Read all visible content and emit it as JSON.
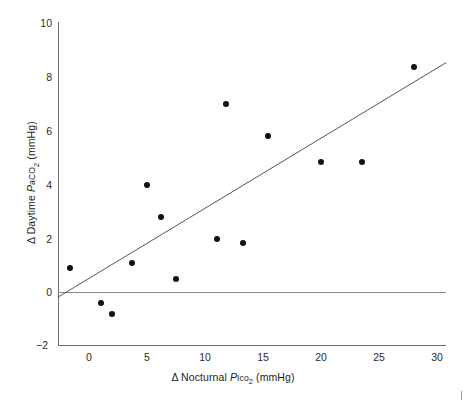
{
  "chart_data": {
    "type": "scatter",
    "title": "",
    "xlabel": "Δ Nocturnal PIco2 (mmHg)",
    "ylabel": "Δ Daytime PaCO2 (mmHg)",
    "xlim": [
      -2.7,
      30.8
    ],
    "ylim": [
      -2,
      10
    ],
    "xticks": [
      0,
      5,
      10,
      15,
      20,
      25,
      30
    ],
    "yticks": [
      -2,
      0,
      2,
      4,
      6,
      8,
      10
    ],
    "grid": false,
    "legend": null,
    "x": [
      -1.6,
      1.0,
      2.0,
      3.7,
      5.0,
      6.2,
      7.5,
      11.0,
      11.8,
      13.3,
      15.4,
      20.0,
      23.5,
      28.0
    ],
    "y": [
      0.9,
      -0.4,
      -0.8,
      1.1,
      4.0,
      2.8,
      0.5,
      2.0,
      7.0,
      1.85,
      5.8,
      4.85,
      4.85,
      8.4
    ],
    "points": [
      {
        "x": -1.6,
        "y": 0.9
      },
      {
        "x": 1.0,
        "y": -0.4
      },
      {
        "x": 2.0,
        "y": -0.8
      },
      {
        "x": 3.7,
        "y": 1.1
      },
      {
        "x": 5.0,
        "y": 4.0
      },
      {
        "x": 6.2,
        "y": 2.8
      },
      {
        "x": 7.5,
        "y": 0.5
      },
      {
        "x": 11.0,
        "y": 2.0
      },
      {
        "x": 11.8,
        "y": 7.0
      },
      {
        "x": 13.3,
        "y": 1.85
      },
      {
        "x": 15.4,
        "y": 5.8
      },
      {
        "x": 20.0,
        "y": 4.85
      },
      {
        "x": 23.5,
        "y": 4.85
      },
      {
        "x": 28.0,
        "y": 8.4
      }
    ],
    "marker": {
      "shape": "circle",
      "color": "#111111",
      "size": 6
    },
    "annotations": [
      {
        "name": "regression-line",
        "type": "line",
        "x0": -2.7,
        "y0": -0.18,
        "x1": 30.8,
        "y1": 8.55,
        "color": "#555555",
        "width": 1
      },
      {
        "name": "zero-reference-line",
        "type": "hline",
        "y": 0.03,
        "color": "#8a8a8a",
        "width": 1
      }
    ]
  },
  "axes": {
    "x": {
      "tick_labels": [
        "0",
        "5",
        "10",
        "15",
        "20",
        "25",
        "30"
      ],
      "title_parts": {
        "delta": "Δ",
        "word": "Nocturnal",
        "symbol_p": "P",
        "symbol_sub": "Ico",
        "symbol_num": "2",
        "units": "(mmHg)"
      }
    },
    "y": {
      "tick_labels": [
        "10",
        "8",
        "6",
        "4",
        "2",
        "0",
        "−2"
      ],
      "title_parts": {
        "delta": "Δ",
        "word": "Daytime",
        "symbol_p": "P",
        "symbol_sub": "a",
        "symbol_co": "CO",
        "symbol_num": "2",
        "units": "(mmHg)"
      }
    }
  }
}
